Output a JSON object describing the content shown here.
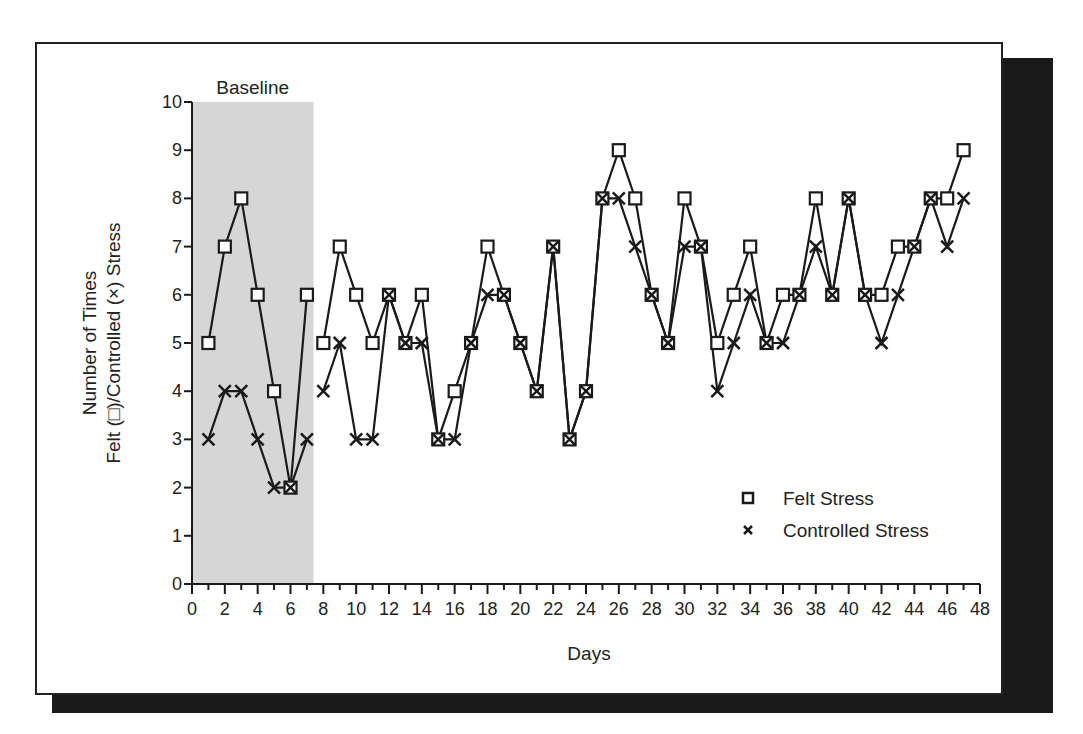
{
  "chart_data": {
    "type": "line",
    "title": "",
    "xlabel": "Days",
    "ylabel_line1": "Number of Times",
    "ylabel_line2": "Felt (□)/Controlled (×) Stress",
    "xlim": [
      0,
      48
    ],
    "ylim": [
      0,
      10
    ],
    "x_ticks": [
      0,
      2,
      4,
      6,
      8,
      10,
      12,
      14,
      16,
      18,
      20,
      22,
      24,
      26,
      28,
      30,
      32,
      34,
      36,
      38,
      40,
      42,
      44,
      46,
      48
    ],
    "y_ticks": [
      0,
      1,
      2,
      3,
      4,
      5,
      6,
      7,
      8,
      9,
      10
    ],
    "grid": false,
    "legend_position": "lower right",
    "phases": [
      {
        "label": "Baseline",
        "x_start": 0,
        "x_end": 7.4,
        "shaded": true,
        "color": "#d6d6d6"
      }
    ],
    "phase_break_after_day": 7,
    "series": [
      {
        "name": "Felt Stress",
        "marker": "square",
        "x": [
          1,
          2,
          3,
          4,
          5,
          6,
          7,
          8,
          9,
          10,
          11,
          12,
          13,
          14,
          15,
          16,
          17,
          18,
          19,
          20,
          21,
          22,
          23,
          24,
          25,
          26,
          27,
          28,
          29,
          30,
          31,
          32,
          33,
          34,
          35,
          36,
          37,
          38,
          39,
          40,
          41,
          42,
          43,
          44,
          45,
          46,
          47
        ],
        "values": [
          5,
          7,
          8,
          6,
          4,
          2,
          6,
          5,
          7,
          6,
          5,
          6,
          5,
          6,
          3,
          4,
          5,
          7,
          6,
          5,
          4,
          7,
          3,
          4,
          8,
          9,
          8,
          6,
          5,
          8,
          7,
          5,
          6,
          7,
          5,
          6,
          6,
          8,
          6,
          8,
          6,
          6,
          7,
          7,
          8,
          8,
          9
        ]
      },
      {
        "name": "Controlled Stress",
        "marker": "x",
        "x": [
          1,
          2,
          3,
          4,
          5,
          6,
          7,
          8,
          9,
          10,
          11,
          12,
          13,
          14,
          15,
          16,
          17,
          18,
          19,
          20,
          21,
          22,
          23,
          24,
          25,
          26,
          27,
          28,
          29,
          30,
          31,
          32,
          33,
          34,
          35,
          36,
          37,
          38,
          39,
          40,
          41,
          42,
          43,
          44,
          45,
          46,
          47
        ],
        "values": [
          3,
          4,
          4,
          3,
          2,
          2,
          3,
          4,
          5,
          3,
          3,
          6,
          5,
          5,
          3,
          3,
          5,
          6,
          6,
          5,
          4,
          7,
          3,
          4,
          8,
          8,
          7,
          6,
          5,
          7,
          7,
          4,
          5,
          6,
          5,
          5,
          6,
          7,
          6,
          8,
          6,
          5,
          6,
          7,
          8,
          7,
          8
        ]
      }
    ]
  },
  "legend": {
    "items": [
      {
        "label": "Felt Stress",
        "icon": "square-marker-icon"
      },
      {
        "label": "Controlled Stress",
        "icon": "x-marker-icon"
      }
    ]
  },
  "phase_label": "Baseline",
  "colors": {
    "line": "#1a1a1a",
    "baseline_shade": "#d6d6d6",
    "shadow": "#1a1a1a"
  }
}
